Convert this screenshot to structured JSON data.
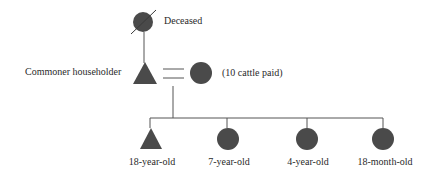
{
  "colors": {
    "symbol_fill": "#4a4a4a",
    "line": "#555555",
    "text": "#2a2a2a"
  },
  "legend": {
    "deceased_label": "Deceased"
  },
  "nodes": {
    "grandparent": {
      "shape": "circle",
      "status": "deceased",
      "cx": 143,
      "cy": 22,
      "r": 10
    },
    "householder": {
      "shape": "triangle",
      "label": "Commoner householder",
      "cx": 145,
      "cy": 74
    },
    "wife": {
      "shape": "circle",
      "label": "(10 cattle paid)",
      "cx": 201,
      "cy": 73,
      "r": 11
    },
    "children": [
      {
        "shape": "triangle",
        "label": "18-year-old",
        "cx": 151,
        "cy": 139
      },
      {
        "shape": "circle",
        "label": "7-year-old",
        "cx": 228,
        "cy": 139,
        "r": 11
      },
      {
        "shape": "circle",
        "label": "4-year-old",
        "cx": 307,
        "cy": 139,
        "r": 11
      },
      {
        "shape": "circle",
        "label": "18-month-old",
        "cx": 383,
        "cy": 139,
        "r": 11
      }
    ]
  },
  "relations": {
    "marriage_symbol": "=",
    "descent_line_y": 118
  }
}
